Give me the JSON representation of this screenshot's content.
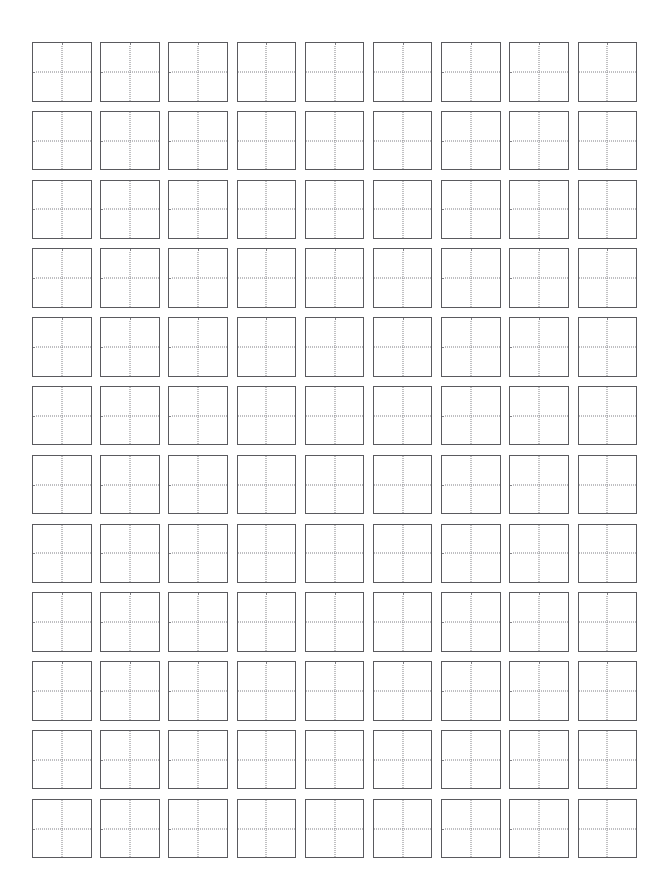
{
  "page": {
    "background_color": "#ffffff",
    "width": 665,
    "height": 896
  },
  "grid": {
    "name": "character-practice-grid",
    "columns": 9,
    "rows": 12,
    "total_cells": 108,
    "cell_type": "tian-zi-ge",
    "cell_content": "",
    "border_color": "#5a5a5e",
    "guide_color": "#808085",
    "guide_style": "dotted",
    "cell_fill_color": "#ffffff",
    "cell_size_px": 60,
    "column_gap_px": 8,
    "row_gap_px": 9,
    "margin_left_px": 32,
    "margin_top_px": 42,
    "cells": [
      {
        "row": 1,
        "col": 1,
        "value": ""
      },
      {
        "row": 1,
        "col": 2,
        "value": ""
      },
      {
        "row": 1,
        "col": 3,
        "value": ""
      },
      {
        "row": 1,
        "col": 4,
        "value": ""
      },
      {
        "row": 1,
        "col": 5,
        "value": ""
      },
      {
        "row": 1,
        "col": 6,
        "value": ""
      },
      {
        "row": 1,
        "col": 7,
        "value": ""
      },
      {
        "row": 1,
        "col": 8,
        "value": ""
      },
      {
        "row": 1,
        "col": 9,
        "value": ""
      },
      {
        "row": 2,
        "col": 1,
        "value": ""
      },
      {
        "row": 2,
        "col": 2,
        "value": ""
      },
      {
        "row": 2,
        "col": 3,
        "value": ""
      },
      {
        "row": 2,
        "col": 4,
        "value": ""
      },
      {
        "row": 2,
        "col": 5,
        "value": ""
      },
      {
        "row": 2,
        "col": 6,
        "value": ""
      },
      {
        "row": 2,
        "col": 7,
        "value": ""
      },
      {
        "row": 2,
        "col": 8,
        "value": ""
      },
      {
        "row": 2,
        "col": 9,
        "value": ""
      },
      {
        "row": 3,
        "col": 1,
        "value": ""
      },
      {
        "row": 3,
        "col": 2,
        "value": ""
      },
      {
        "row": 3,
        "col": 3,
        "value": ""
      },
      {
        "row": 3,
        "col": 4,
        "value": ""
      },
      {
        "row": 3,
        "col": 5,
        "value": ""
      },
      {
        "row": 3,
        "col": 6,
        "value": ""
      },
      {
        "row": 3,
        "col": 7,
        "value": ""
      },
      {
        "row": 3,
        "col": 8,
        "value": ""
      },
      {
        "row": 3,
        "col": 9,
        "value": ""
      },
      {
        "row": 4,
        "col": 1,
        "value": ""
      },
      {
        "row": 4,
        "col": 2,
        "value": ""
      },
      {
        "row": 4,
        "col": 3,
        "value": ""
      },
      {
        "row": 4,
        "col": 4,
        "value": ""
      },
      {
        "row": 4,
        "col": 5,
        "value": ""
      },
      {
        "row": 4,
        "col": 6,
        "value": ""
      },
      {
        "row": 4,
        "col": 7,
        "value": ""
      },
      {
        "row": 4,
        "col": 8,
        "value": ""
      },
      {
        "row": 4,
        "col": 9,
        "value": ""
      },
      {
        "row": 5,
        "col": 1,
        "value": ""
      },
      {
        "row": 5,
        "col": 2,
        "value": ""
      },
      {
        "row": 5,
        "col": 3,
        "value": ""
      },
      {
        "row": 5,
        "col": 4,
        "value": ""
      },
      {
        "row": 5,
        "col": 5,
        "value": ""
      },
      {
        "row": 5,
        "col": 6,
        "value": ""
      },
      {
        "row": 5,
        "col": 7,
        "value": ""
      },
      {
        "row": 5,
        "col": 8,
        "value": ""
      },
      {
        "row": 5,
        "col": 9,
        "value": ""
      },
      {
        "row": 6,
        "col": 1,
        "value": ""
      },
      {
        "row": 6,
        "col": 2,
        "value": ""
      },
      {
        "row": 6,
        "col": 3,
        "value": ""
      },
      {
        "row": 6,
        "col": 4,
        "value": ""
      },
      {
        "row": 6,
        "col": 5,
        "value": ""
      },
      {
        "row": 6,
        "col": 6,
        "value": ""
      },
      {
        "row": 6,
        "col": 7,
        "value": ""
      },
      {
        "row": 6,
        "col": 8,
        "value": ""
      },
      {
        "row": 6,
        "col": 9,
        "value": ""
      },
      {
        "row": 7,
        "col": 1,
        "value": ""
      },
      {
        "row": 7,
        "col": 2,
        "value": ""
      },
      {
        "row": 7,
        "col": 3,
        "value": ""
      },
      {
        "row": 7,
        "col": 4,
        "value": ""
      },
      {
        "row": 7,
        "col": 5,
        "value": ""
      },
      {
        "row": 7,
        "col": 6,
        "value": ""
      },
      {
        "row": 7,
        "col": 7,
        "value": ""
      },
      {
        "row": 7,
        "col": 8,
        "value": ""
      },
      {
        "row": 7,
        "col": 9,
        "value": ""
      },
      {
        "row": 8,
        "col": 1,
        "value": ""
      },
      {
        "row": 8,
        "col": 2,
        "value": ""
      },
      {
        "row": 8,
        "col": 3,
        "value": ""
      },
      {
        "row": 8,
        "col": 4,
        "value": ""
      },
      {
        "row": 8,
        "col": 5,
        "value": ""
      },
      {
        "row": 8,
        "col": 6,
        "value": ""
      },
      {
        "row": 8,
        "col": 7,
        "value": ""
      },
      {
        "row": 8,
        "col": 8,
        "value": ""
      },
      {
        "row": 8,
        "col": 9,
        "value": ""
      },
      {
        "row": 9,
        "col": 1,
        "value": ""
      },
      {
        "row": 9,
        "col": 2,
        "value": ""
      },
      {
        "row": 9,
        "col": 3,
        "value": ""
      },
      {
        "row": 9,
        "col": 4,
        "value": ""
      },
      {
        "row": 9,
        "col": 5,
        "value": ""
      },
      {
        "row": 9,
        "col": 6,
        "value": ""
      },
      {
        "row": 9,
        "col": 7,
        "value": ""
      },
      {
        "row": 9,
        "col": 8,
        "value": ""
      },
      {
        "row": 9,
        "col": 9,
        "value": ""
      },
      {
        "row": 10,
        "col": 1,
        "value": ""
      },
      {
        "row": 10,
        "col": 2,
        "value": ""
      },
      {
        "row": 10,
        "col": 3,
        "value": ""
      },
      {
        "row": 10,
        "col": 4,
        "value": ""
      },
      {
        "row": 10,
        "col": 5,
        "value": ""
      },
      {
        "row": 10,
        "col": 6,
        "value": ""
      },
      {
        "row": 10,
        "col": 7,
        "value": ""
      },
      {
        "row": 10,
        "col": 8,
        "value": ""
      },
      {
        "row": 10,
        "col": 9,
        "value": ""
      },
      {
        "row": 11,
        "col": 1,
        "value": ""
      },
      {
        "row": 11,
        "col": 2,
        "value": ""
      },
      {
        "row": 11,
        "col": 3,
        "value": ""
      },
      {
        "row": 11,
        "col": 4,
        "value": ""
      },
      {
        "row": 11,
        "col": 5,
        "value": ""
      },
      {
        "row": 11,
        "col": 6,
        "value": ""
      },
      {
        "row": 11,
        "col": 7,
        "value": ""
      },
      {
        "row": 11,
        "col": 8,
        "value": ""
      },
      {
        "row": 11,
        "col": 9,
        "value": ""
      },
      {
        "row": 12,
        "col": 1,
        "value": ""
      },
      {
        "row": 12,
        "col": 2,
        "value": ""
      },
      {
        "row": 12,
        "col": 3,
        "value": ""
      },
      {
        "row": 12,
        "col": 4,
        "value": ""
      },
      {
        "row": 12,
        "col": 5,
        "value": ""
      },
      {
        "row": 12,
        "col": 6,
        "value": ""
      },
      {
        "row": 12,
        "col": 7,
        "value": ""
      },
      {
        "row": 12,
        "col": 8,
        "value": ""
      },
      {
        "row": 12,
        "col": 9,
        "value": ""
      }
    ]
  }
}
